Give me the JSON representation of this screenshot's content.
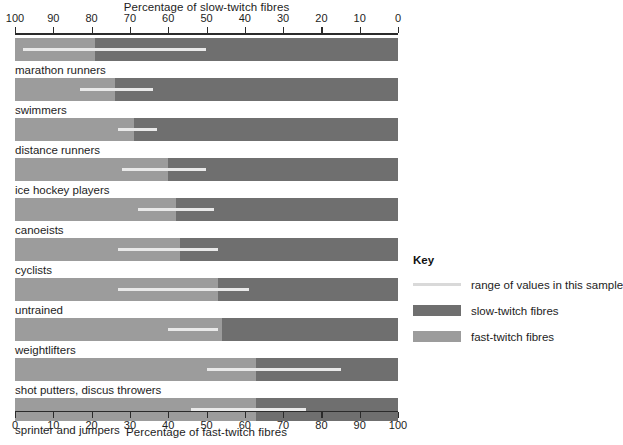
{
  "chart_data": {
    "type": "bar",
    "title": "",
    "xlabel": "Percentage of fast-twitch fibres",
    "top_axis_label": "Percentage of slow-twitch fibres",
    "bottom_axis_label": "Percentage of fast-twitch fibres",
    "top_ticks": [
      100,
      90,
      80,
      70,
      60,
      50,
      40,
      30,
      20,
      10,
      0
    ],
    "bottom_ticks": [
      0,
      10,
      20,
      30,
      40,
      50,
      60,
      70,
      80,
      90,
      100
    ],
    "xlim": [
      0,
      100
    ],
    "grid": false,
    "orientation": "horizontal",
    "legend_position": "right",
    "note": "Each bar is split at the mean percentage of fast-twitch fibres (measured from the left / bottom axis). The light overlay line shows the range of values in the sample, also on the fast-twitch scale.",
    "categories": [
      "marathon runners",
      "swimmers",
      "distance runners",
      "ice hockey players",
      "canoeists",
      "cyclists",
      "untrained",
      "weightlifters",
      "shot putters, discus throwers",
      "sprinter and jumpers"
    ],
    "series": [
      {
        "name": "fast-twitch fibres",
        "values": [
          21,
          26,
          31,
          40,
          42,
          43,
          53,
          54,
          63,
          63
        ]
      },
      {
        "name": "slow-twitch fibres",
        "values": [
          79,
          74,
          69,
          60,
          58,
          57,
          47,
          46,
          37,
          37
        ]
      }
    ],
    "range_of_values": [
      {
        "category": "marathon runners",
        "min": 2,
        "max": 50
      },
      {
        "category": "swimmers",
        "min": 17,
        "max": 36
      },
      {
        "category": "distance runners",
        "min": 27,
        "max": 37
      },
      {
        "category": "ice hockey players",
        "min": 28,
        "max": 50
      },
      {
        "category": "canoeists",
        "min": 32,
        "max": 52
      },
      {
        "category": "cyclists",
        "min": 27,
        "max": 53
      },
      {
        "category": "untrained",
        "min": 27,
        "max": 61
      },
      {
        "category": "weightlifters",
        "min": 40,
        "max": 53
      },
      {
        "category": "shot putters, discus throwers",
        "min": 50,
        "max": 85
      },
      {
        "category": "sprinter and jumpers",
        "min": 46,
        "max": 76
      }
    ]
  },
  "key": {
    "title": "Key",
    "items": [
      {
        "swatch": "line",
        "label": "range of values in this sample"
      },
      {
        "swatch": "slow",
        "label": "slow-twitch fibres"
      },
      {
        "swatch": "fast",
        "label": "fast-twitch fibres"
      }
    ]
  },
  "colors": {
    "slow_twitch": "#6f6f6f",
    "fast_twitch": "#9c9c9c",
    "range_line": "#e9e9e9",
    "axis": "#2b2b2b",
    "text": "#1d1d1d",
    "background": "#ffffff"
  }
}
